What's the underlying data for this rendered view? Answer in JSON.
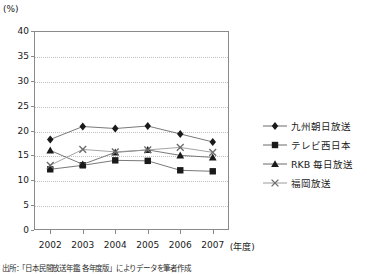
{
  "chart_data": {
    "type": "line",
    "title": "",
    "subtitle": "",
    "xlabel": "(年度)",
    "ylabel": "(%)",
    "unit_label": "(%)",
    "categories": [
      "2002",
      "2003",
      "2004",
      "2005",
      "2006",
      "2007"
    ],
    "ylim": [
      0,
      40
    ],
    "ytick_values": [
      0,
      5,
      10,
      15,
      20,
      25,
      30,
      35,
      40
    ],
    "ytick_labels": [
      "0",
      "5",
      "10",
      "15",
      "20",
      "25",
      "30",
      "35",
      "40"
    ],
    "grid": true,
    "legend_position": "right",
    "series": [
      {
        "name": "九州朝日放送",
        "marker": "diamond",
        "color": "#1a1a1a",
        "values": [
          18.2,
          20.8,
          20.4,
          20.9,
          19.3,
          17.7
        ]
      },
      {
        "name": "テレビ西日本",
        "marker": "square",
        "color": "#1a1a1a",
        "values": [
          12.2,
          13.0,
          14.0,
          13.9,
          12.0,
          11.8
        ]
      },
      {
        "name": "RKB 毎日放送",
        "marker": "triangle",
        "color": "#1a1a1a",
        "values": [
          16.0,
          13.2,
          15.6,
          16.1,
          15.0,
          14.6
        ]
      },
      {
        "name": "福岡放送",
        "marker": "cross",
        "color": "#6b6b6b",
        "values": [
          13.0,
          16.2,
          15.7,
          16.1,
          16.6,
          15.6
        ]
      }
    ]
  },
  "legend": {
    "items": [
      {
        "label": "九州朝日放送",
        "marker": "diamond"
      },
      {
        "label": "テレビ西日本",
        "marker": "square"
      },
      {
        "label": "RKB 毎日放送",
        "marker": "triangle"
      },
      {
        "label": "福岡放送",
        "marker": "cross"
      }
    ]
  },
  "footer": {
    "source": "出所：「日本民間放送年鑑 各年度版」によりデータを筆者作成"
  },
  "colors": {
    "axis": "#8a8a8a",
    "grid": "#c2c2c2",
    "line_dark": "#555555",
    "marker_dark": "#1a1a1a",
    "marker_light": "#6b6b6b",
    "text": "#1a1a1a"
  }
}
